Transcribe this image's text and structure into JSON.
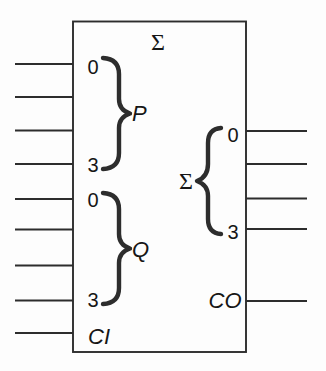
{
  "diagram": {
    "title_symbol": "Σ",
    "left_pins": {
      "p_group": {
        "first_index": "0",
        "last_index": "3",
        "label": "P",
        "brace": "}",
        "wire_count": 4
      },
      "q_group": {
        "first_index": "0",
        "last_index": "3",
        "label": "Q",
        "brace": "}",
        "wire_count": 4
      },
      "carry_in": {
        "label": "CI",
        "wire_count": 1
      }
    },
    "right_pins": {
      "sum_group": {
        "first_index": "0",
        "last_index": "3",
        "label": "Σ",
        "brace": "{",
        "wire_count": 4
      },
      "carry_out": {
        "label": "CO",
        "wire_count": 1
      }
    },
    "colors": {
      "line": "#2d2d2d",
      "text": "#161616",
      "background": "#fdfdfd"
    }
  }
}
